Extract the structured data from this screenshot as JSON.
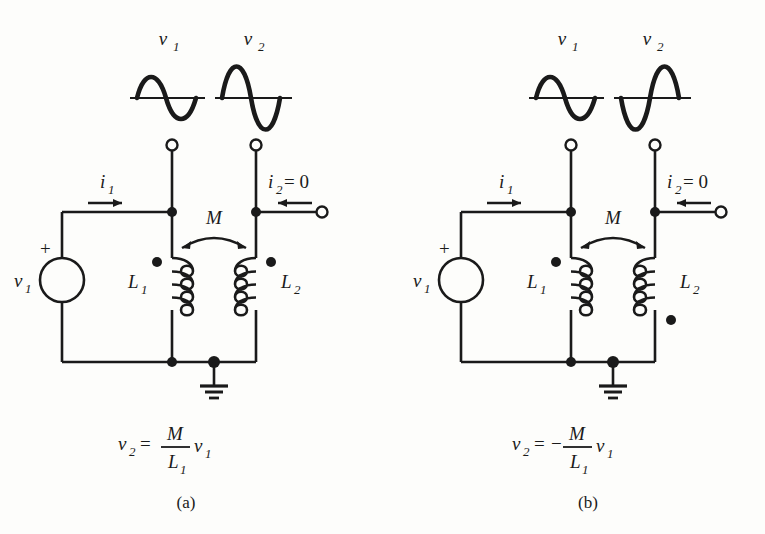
{
  "figure": {
    "background_color": "#fdfdfb",
    "ink_color": "#1a1a1a"
  },
  "panels": [
    {
      "id": "a",
      "caption": "(a)",
      "equation": {
        "lhs": "v",
        "lhs_sub": "2",
        "equals": "=",
        "sign": "",
        "numerator": "M",
        "denominator": "L",
        "denominator_sub": "1",
        "rhs": "v",
        "rhs_sub": "1",
        "plain": "v2 = (M/L1) v1"
      },
      "waveforms": [
        {
          "name": "v1",
          "label": "v",
          "label_sub": "1",
          "polarity": "positive-first",
          "amplitude": "small"
        },
        {
          "name": "v2",
          "label": "v",
          "label_sub": "2",
          "polarity": "positive-first",
          "amplitude": "large"
        }
      ],
      "source": {
        "label": "v",
        "label_sub": "1",
        "polarity_marker": "+",
        "type": "ac-voltage-source"
      },
      "currents": [
        {
          "label": "i",
          "label_sub": "1",
          "value": "",
          "direction": "right"
        },
        {
          "label": "i",
          "label_sub": "2",
          "value": "= 0",
          "direction": "left"
        }
      ],
      "inductors": [
        {
          "label": "L",
          "label_sub": "1",
          "dot_position": "top-left"
        },
        {
          "label": "L",
          "label_sub": "2",
          "dot_position": "top-right"
        }
      ],
      "coupling": {
        "label": "M",
        "arrow": "double-headed-arc"
      },
      "ground": true
    },
    {
      "id": "b",
      "caption": "(b)",
      "equation": {
        "lhs": "v",
        "lhs_sub": "2",
        "equals": "=",
        "sign": "−",
        "numerator": "M",
        "denominator": "L",
        "denominator_sub": "1",
        "rhs": "v",
        "rhs_sub": "1",
        "plain": "v2 = -(M/L1) v1"
      },
      "waveforms": [
        {
          "name": "v1",
          "label": "v",
          "label_sub": "1",
          "polarity": "positive-first",
          "amplitude": "small"
        },
        {
          "name": "v2",
          "label": "v",
          "label_sub": "2",
          "polarity": "negative-first",
          "amplitude": "large"
        }
      ],
      "source": {
        "label": "v",
        "label_sub": "1",
        "polarity_marker": "+",
        "type": "ac-voltage-source"
      },
      "currents": [
        {
          "label": "i",
          "label_sub": "1",
          "value": "",
          "direction": "right"
        },
        {
          "label": "i",
          "label_sub": "2",
          "value": "= 0",
          "direction": "left"
        }
      ],
      "inductors": [
        {
          "label": "L",
          "label_sub": "1",
          "dot_position": "top-left"
        },
        {
          "label": "L",
          "label_sub": "2",
          "dot_position": "bottom-right"
        }
      ],
      "coupling": {
        "label": "M",
        "arrow": "double-headed-arc"
      },
      "ground": true
    }
  ]
}
